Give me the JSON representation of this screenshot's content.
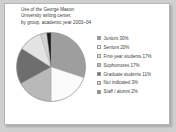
{
  "figure": {
    "title_lines": [
      "Use of the George Mason",
      "University writing center,",
      "by group, academic year 2003–04"
    ]
  },
  "chart_data": {
    "type": "pie",
    "title": "Use of the George Mason University writing center, by group, academic year 2003–04",
    "xlabel": "",
    "ylabel": "",
    "legend_position": "right",
    "grid": false,
    "start_angle_deg": 0,
    "direction": "clockwise",
    "categories": [
      "Juniors",
      "Seniors",
      "First-year students",
      "Sophomores",
      "Graduate students",
      "Not indicated",
      "Staff / alumni"
    ],
    "values": [
      30,
      20,
      17,
      17,
      11,
      3,
      2
    ],
    "value_unit": "%",
    "labels": [
      "Juniors 30%",
      "Seniors 20%",
      "First-year students 17%",
      "Sophomores 17%",
      "Graduate students 11%",
      "Not indicated 3%",
      "Staff / alumni 2%"
    ],
    "colors": [
      "#9e9e9e",
      "#fbfbfb",
      "#e3e3e3",
      "#b9b9b9",
      "#6e6e6e",
      "#d2d2d2",
      "#8a8a8a"
    ],
    "slice_order_clockwise": [
      {
        "name": "Juniors",
        "value": 30,
        "color": "#9e9e9e"
      },
      {
        "name": "Seniors",
        "value": 20,
        "color": "#fbfbfb"
      },
      {
        "name": "Sophomores",
        "value": 17,
        "color": "#b9b9b9"
      },
      {
        "name": "First-year students",
        "value": 17,
        "color": "#6e6e6e"
      },
      {
        "name": "Graduate students",
        "value": 11,
        "color": "#e3e3e3"
      },
      {
        "name": "Not indicated",
        "value": 3,
        "color": "#d2d2d2"
      },
      {
        "name": "Staff / alumni",
        "value": 2,
        "color": "#1c1c1c"
      }
    ]
  }
}
